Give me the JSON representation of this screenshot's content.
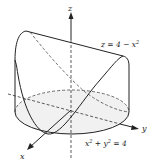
{
  "figure": {
    "axes": {
      "x_label": "x",
      "y_label": "y",
      "z_label": "z"
    },
    "surface_label": {
      "left": "z = 4 − x",
      "exp": "2"
    },
    "cylinder_label": {
      "a": "x",
      "a_exp": "2",
      "mid": " + y",
      "b_exp": "2",
      "rhs": " = 4"
    },
    "colors": {
      "line": "#222222",
      "shade": "#e8e8e8"
    }
  }
}
